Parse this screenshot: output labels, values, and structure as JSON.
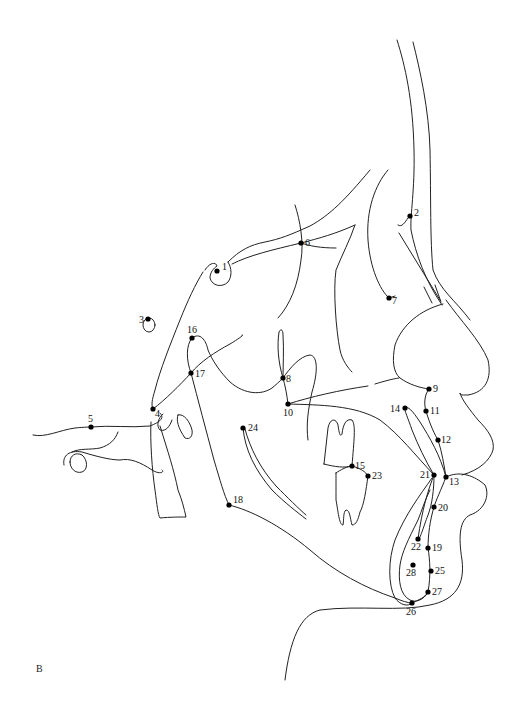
{
  "figure": {
    "panel_label": "B",
    "line_color": "#222222",
    "point_color": "#000000",
    "background": "#ffffff"
  },
  "landmarks": [
    {
      "id": "1",
      "label": "1",
      "x": 217,
      "y": 271,
      "lx": 222,
      "ly": 270
    },
    {
      "id": "2",
      "label": "2",
      "x": 410,
      "y": 216,
      "lx": 414,
      "ly": 216
    },
    {
      "id": "3",
      "label": "3",
      "x": 148,
      "y": 319,
      "lx": 139,
      "ly": 323
    },
    {
      "id": "4",
      "label": "4",
      "x": 153,
      "y": 409,
      "lx": 155,
      "ly": 417
    },
    {
      "id": "5",
      "label": "5",
      "x": 91,
      "y": 427,
      "lx": 88,
      "ly": 422
    },
    {
      "id": "6",
      "label": "6",
      "x": 301,
      "y": 243,
      "lx": 305,
      "ly": 246
    },
    {
      "id": "7",
      "label": "7",
      "x": 389,
      "y": 298,
      "lx": 392,
      "ly": 304
    },
    {
      "id": "8",
      "label": "8",
      "x": 283,
      "y": 378,
      "lx": 286,
      "ly": 382
    },
    {
      "id": "9",
      "label": "9",
      "x": 429,
      "y": 389,
      "lx": 433,
      "ly": 392
    },
    {
      "id": "10",
      "label": "10",
      "x": 288,
      "y": 404,
      "lx": 283,
      "ly": 416
    },
    {
      "id": "11",
      "label": "11",
      "x": 426,
      "y": 411,
      "lx": 430,
      "ly": 414
    },
    {
      "id": "12",
      "label": "12",
      "x": 438,
      "y": 440,
      "lx": 441,
      "ly": 443
    },
    {
      "id": "13",
      "label": "13",
      "x": 446,
      "y": 477,
      "lx": 449,
      "ly": 485
    },
    {
      "id": "14",
      "label": "14",
      "x": 405,
      "y": 408,
      "lx": 390,
      "ly": 412
    },
    {
      "id": "15",
      "label": "15",
      "x": 352,
      "y": 466,
      "lx": 355,
      "ly": 469
    },
    {
      "id": "16",
      "label": "16",
      "x": 192,
      "y": 338,
      "lx": 187,
      "ly": 333
    },
    {
      "id": "17",
      "label": "17",
      "x": 191,
      "y": 373,
      "lx": 195,
      "ly": 377
    },
    {
      "id": "18",
      "label": "18",
      "x": 229,
      "y": 505,
      "lx": 233,
      "ly": 503
    },
    {
      "id": "19",
      "label": "19",
      "x": 428,
      "y": 548,
      "lx": 432,
      "ly": 551
    },
    {
      "id": "20",
      "label": "20",
      "x": 434,
      "y": 507,
      "lx": 438,
      "ly": 511
    },
    {
      "id": "21",
      "label": "21",
      "x": 434,
      "y": 475,
      "lx": 420,
      "ly": 478
    },
    {
      "id": "22",
      "label": "22",
      "x": 418,
      "y": 539,
      "lx": 411,
      "ly": 550
    },
    {
      "id": "23",
      "label": "23",
      "x": 368,
      "y": 476,
      "lx": 372,
      "ly": 479
    },
    {
      "id": "24",
      "label": "24",
      "x": 243,
      "y": 428,
      "lx": 248,
      "ly": 431
    },
    {
      "id": "25",
      "label": "25",
      "x": 431,
      "y": 571,
      "lx": 435,
      "ly": 574
    },
    {
      "id": "26",
      "label": "26",
      "x": 412,
      "y": 603,
      "lx": 406,
      "ly": 615
    },
    {
      "id": "27",
      "label": "27",
      "x": 428,
      "y": 592,
      "lx": 432,
      "ly": 595
    },
    {
      "id": "28",
      "label": "28",
      "x": 413,
      "y": 565,
      "lx": 406,
      "ly": 576
    }
  ]
}
